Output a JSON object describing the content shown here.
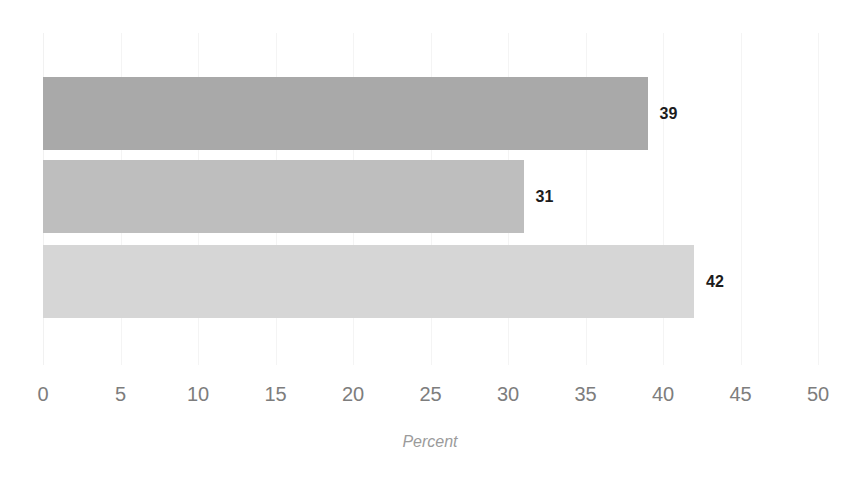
{
  "chart_data": {
    "type": "bar",
    "orientation": "horizontal",
    "title": "",
    "subtitle": "",
    "xlabel": "Percent",
    "ylabel": "",
    "xlim": [
      0,
      50
    ],
    "xticks": [
      0,
      5,
      10,
      15,
      20,
      25,
      30,
      35,
      40,
      45,
      50
    ],
    "xtick_labels": [
      "0",
      "5",
      "10",
      "15",
      "20",
      "25",
      "30",
      "35",
      "40",
      "45",
      "50"
    ],
    "grid": true,
    "grid_axis": "x",
    "legend": false,
    "legend_position": "none",
    "categories": [
      "",
      "",
      ""
    ],
    "values": [
      39,
      31,
      42
    ],
    "data_labels": [
      "39",
      "31",
      "42"
    ],
    "bar_colors": [
      "#a9a9a9",
      "#bebebe",
      "#d6d6d6"
    ],
    "series": [
      {
        "name": "",
        "values": [
          39,
          31,
          42
        ]
      }
    ],
    "bars": [
      {
        "label": "",
        "value": 39,
        "data_label": "39",
        "color": "#a9a9a9"
      },
      {
        "label": "",
        "value": 31,
        "data_label": "31",
        "color": "#bebebe"
      },
      {
        "label": "",
        "value": 42,
        "data_label": "42",
        "color": "#d6d6d6"
      }
    ]
  },
  "colors": {
    "background": "#ffffff",
    "gridline": "#f4f4f4",
    "tick_text": "#7d7d7d",
    "axis_title_text": "#9b9b9b",
    "data_label_text": "#1c1c1c"
  }
}
